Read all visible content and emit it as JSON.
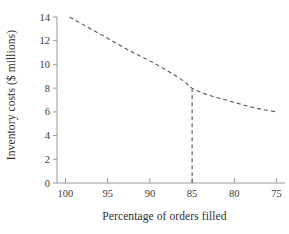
{
  "chart_data": {
    "type": "line",
    "title": "",
    "xlabel": "Percentage of orders filled",
    "ylabel": "Inventory costs ($ millions)",
    "x_ticks": [
      "100",
      "95",
      "90",
      "85",
      "80",
      "75"
    ],
    "x_tick_values": [
      100,
      95,
      90,
      85,
      80,
      75
    ],
    "y_ticks": [
      "0",
      "2",
      "4",
      "6",
      "8",
      "10",
      "12",
      "14"
    ],
    "y_tick_values": [
      0,
      2,
      4,
      6,
      8,
      10,
      12,
      14
    ],
    "xlim": [
      101,
      74
    ],
    "ylim": [
      0,
      14
    ],
    "x_axis_direction": "descending",
    "grid": false,
    "legend": null,
    "series": [
      {
        "name": "Inventory cost curve",
        "style": "dashed",
        "color": "#555555",
        "x": [
          99.5,
          98,
          96,
          94,
          92,
          90,
          88,
          86,
          85,
          83,
          81,
          79,
          77,
          75
        ],
        "y": [
          14.0,
          13.4,
          12.6,
          11.8,
          11.0,
          10.3,
          9.5,
          8.6,
          8.0,
          7.4,
          7.0,
          6.6,
          6.25,
          6.0
        ]
      }
    ],
    "annotations": [
      {
        "name": "drop-line",
        "style": "dashed",
        "color": "#555555",
        "from": {
          "x": 85,
          "y": 8
        },
        "to": {
          "x": 85,
          "y": 0
        }
      }
    ],
    "axis_color": "#9a9a9a",
    "curve_color": "#555555"
  }
}
